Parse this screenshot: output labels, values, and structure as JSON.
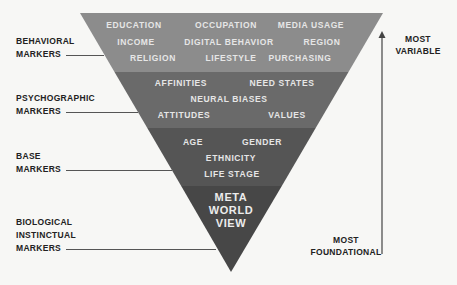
{
  "colors": {
    "background": "#f7f7f5",
    "band_behavioral": "#8c8c8c",
    "band_psychographic": "#6a6a6a",
    "band_base": "#555555",
    "band_meta": "#474747",
    "band_text": "#e6e6e6",
    "label_text": "#222222"
  },
  "bands": {
    "behavioral": {
      "items": [
        "EDUCATION",
        "OCCUPATION",
        "MEDIA USAGE",
        "INCOME",
        "DIGITAL BEHAVIOR",
        "REGION",
        "RELIGION",
        "LIFESTYLE",
        "PURCHASING"
      ]
    },
    "psychographic": {
      "items": [
        "AFFINITIES",
        "NEED STATES",
        "NEURAL BIASES",
        "ATTITUDES",
        "VALUES"
      ]
    },
    "base": {
      "items": [
        "AGE",
        "GENDER",
        "ETHNICITY",
        "LIFE STAGE"
      ]
    },
    "meta": {
      "lines": [
        "META",
        "WORLD",
        "VIEW"
      ]
    }
  },
  "side_labels": {
    "behavioral": [
      "BEHAVIORAL",
      "MARKERS"
    ],
    "psychographic": [
      "PSYCHOGRAPHIC",
      "MARKERS"
    ],
    "base": [
      "BASE",
      "MARKERS"
    ],
    "biological": [
      "BIOLOGICAL",
      "INSTINCTUAL",
      "MARKERS"
    ]
  },
  "axis": {
    "top_label": [
      "MOST",
      "VARIABLE"
    ],
    "bottom_label": [
      "MOST",
      "FOUNDATIONAL"
    ],
    "direction": "up"
  }
}
